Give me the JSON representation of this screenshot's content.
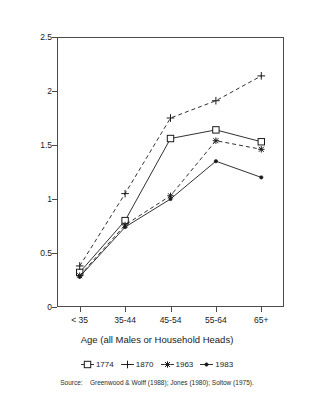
{
  "chart_data": {
    "type": "line",
    "title": "",
    "xlabel": "Age (all Males or Household Heads)",
    "ylabel": "",
    "categories": [
      "< 35",
      "35-44",
      "45-54",
      "55-64",
      "65+"
    ],
    "ylim": [
      0,
      2.5
    ],
    "yticks": [
      "0",
      "0.5",
      "1",
      "1.5",
      "2",
      "2.5"
    ],
    "ytick_values": [
      0,
      0.5,
      1,
      1.5,
      2,
      2.5
    ],
    "grid": false,
    "legend_position": "bottom",
    "series": [
      {
        "name": "1774",
        "marker": "square",
        "linestyle": "solid",
        "color": "#1a1a1a",
        "values": [
          0.32,
          0.8,
          1.56,
          1.64,
          1.53
        ]
      },
      {
        "name": "1870",
        "marker": "plus",
        "linestyle": "dashed",
        "color": "#1a1a1a",
        "values": [
          0.38,
          1.05,
          1.75,
          1.91,
          2.14
        ]
      },
      {
        "name": "1963",
        "marker": "asterisk",
        "linestyle": "dashed",
        "color": "#1a1a1a",
        "values": [
          0.29,
          0.76,
          1.03,
          1.54,
          1.46
        ]
      },
      {
        "name": "1983",
        "marker": "dot",
        "linestyle": "solid",
        "color": "#1a1a1a",
        "values": [
          0.28,
          0.74,
          1.0,
          1.35,
          1.2
        ]
      }
    ]
  },
  "source": {
    "label": "Source:",
    "text": "Greenwood & Wolff (1988); Jones (1980); Soltow (1975)."
  }
}
